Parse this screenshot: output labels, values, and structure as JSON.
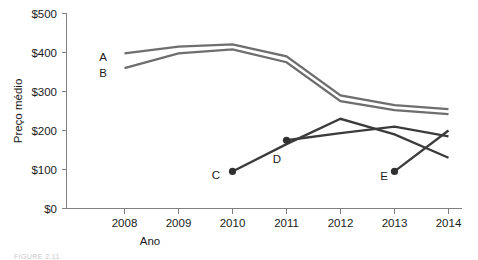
{
  "chart_data": {
    "type": "line",
    "title": "",
    "xlabel": "Ano",
    "ylabel": "Preço médio",
    "x": [
      2008,
      2009,
      2010,
      2011,
      2012,
      2013,
      2014
    ],
    "xtick_labels": [
      "2008",
      "2009",
      "2010",
      "2011",
      "2012",
      "2013",
      "2014"
    ],
    "ytick_labels": [
      "$0",
      "$100",
      "$200",
      "$300",
      "$400",
      "$500"
    ],
    "ytick_values": [
      0,
      100,
      200,
      300,
      400,
      500
    ],
    "ylim": [
      0,
      500
    ],
    "xlim": [
      2007.6,
      2014.2
    ],
    "grid": false,
    "legend": "inline-series-labels",
    "series": [
      {
        "name": "A",
        "color": "#6e6e6e",
        "label_position": "left-of-line-start",
        "x": [
          2008,
          2009,
          2010,
          2011,
          2012,
          2013,
          2014
        ],
        "values": [
          398,
          415,
          421,
          390,
          290,
          265,
          255
        ]
      },
      {
        "name": "B",
        "color": "#6e6e6e",
        "label_position": "left-of-line-start",
        "x": [
          2008,
          2009,
          2010,
          2011,
          2012,
          2013,
          2014
        ],
        "values": [
          360,
          398,
          408,
          375,
          275,
          252,
          242
        ]
      },
      {
        "name": "C",
        "color": "#3b3b3b",
        "label_position": "left-of-start-marker",
        "start_marker": true,
        "x": [
          2010,
          2011,
          2012,
          2013,
          2014
        ],
        "values": [
          95,
          165,
          230,
          190,
          130
        ]
      },
      {
        "name": "D",
        "color": "#3b3b3b",
        "label_position": "left-of-start-marker",
        "start_marker": true,
        "x": [
          2011,
          2012,
          2013,
          2014
        ],
        "values": [
          175,
          193,
          210,
          185
        ]
      },
      {
        "name": "E",
        "color": "#3b3b3b",
        "label_position": "left-of-start-marker",
        "start_marker": true,
        "x": [
          2013,
          2014
        ],
        "values": [
          95,
          200
        ]
      }
    ],
    "annotations": [
      {
        "text": "A",
        "x_px": 103,
        "y_px": 57
      },
      {
        "text": "B",
        "x_px": 103,
        "y_px": 73
      },
      {
        "text": "C",
        "x_px": 215,
        "y_px": 175
      },
      {
        "text": "D",
        "x_px": 276,
        "y_px": 159
      },
      {
        "text": "E",
        "x_px": 383,
        "y_px": 176
      }
    ]
  },
  "caption": {
    "text": "FIGURE 2.11"
  }
}
